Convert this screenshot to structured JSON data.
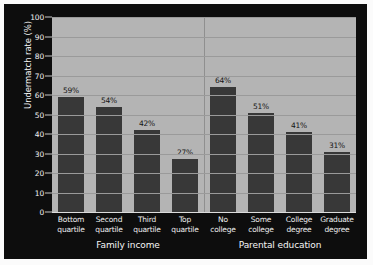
{
  "chart_data": {
    "type": "bar",
    "title": "",
    "xlabel": "",
    "ylabel": "Undermatch rate (%)",
    "ylim": [
      0,
      100
    ],
    "ytick_values": [
      0,
      10,
      20,
      30,
      40,
      50,
      60,
      70,
      80,
      90,
      100
    ],
    "ytick_labels": [
      "0",
      "10",
      "20",
      "30",
      "40",
      "50",
      "60",
      "70",
      "80",
      "90",
      "100"
    ],
    "grid": true,
    "legend": "none",
    "categories": [
      "Bottom quartile",
      "Second quartile",
      "Third quartile",
      "Top quartile",
      "No college",
      "Some college",
      "College degree",
      "Graduate degree"
    ],
    "category_lines": [
      [
        "Bottom",
        "quartile"
      ],
      [
        "Second",
        "quartile"
      ],
      [
        "Third",
        "quartile"
      ],
      [
        "Top",
        "quartile"
      ],
      [
        "No",
        "college"
      ],
      [
        "Some",
        "college"
      ],
      [
        "College",
        "degree"
      ],
      [
        "Graduate",
        "degree"
      ]
    ],
    "values": [
      59,
      54,
      42,
      27,
      64,
      51,
      41,
      31
    ],
    "data_labels": [
      "59%",
      "54%",
      "42%",
      "27%",
      "64%",
      "51%",
      "41%",
      "31%"
    ],
    "groups": [
      {
        "label": "Family income",
        "start_index": 0,
        "end_index": 3
      },
      {
        "label": "Parental education",
        "start_index": 4,
        "end_index": 7
      }
    ],
    "colors": {
      "bar": "#383838",
      "plot_background": "#b4b4b4",
      "panel_background": "#0d0d0d",
      "gridline": "#9a9a9a",
      "axis_text": "#f0f0f0",
      "data_label_text": "#151515"
    }
  }
}
